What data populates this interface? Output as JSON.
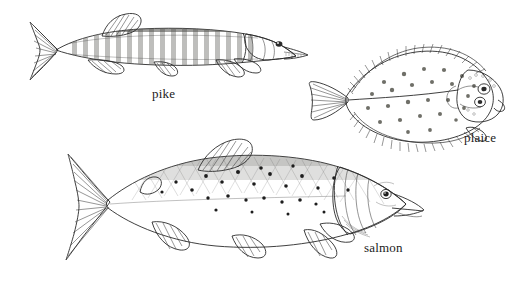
{
  "plate": {
    "title": "Fish species illustration plate",
    "background_color": "#ffffff",
    "ink_color": "#2a2a2a",
    "width": 532,
    "height": 282,
    "style": "grayscale pen-and-ink scientific illustration"
  },
  "figures": [
    {
      "id": "pike",
      "label": "pike",
      "orientation": "facing right",
      "body_fill": "#9b9b97",
      "belly_fill": "#dededa",
      "markings": "vertical pale bars along flank",
      "bbox": {
        "x": 30,
        "y": 14,
        "width": 275,
        "height": 73
      }
    },
    {
      "id": "plaice",
      "label": "plaice",
      "orientation": "facing right",
      "body_fill": "#b0b0ab",
      "belly_fill": "#c6c6c1",
      "markings": "scattered round spots on flatfish disc",
      "bbox": {
        "x": 310,
        "y": 44,
        "width": 190,
        "height": 102
      }
    },
    {
      "id": "salmon",
      "label": "salmon",
      "orientation": "facing right",
      "body_fill": "#a8a8a3",
      "belly_fill": "#f2f2ee",
      "markings": "dark x-shaped spots over stippled flank",
      "bbox": {
        "x": 58,
        "y": 140,
        "width": 370,
        "height": 120
      }
    }
  ],
  "captions": {
    "pike": "pike",
    "plaice": "plaice",
    "salmon": "salmon"
  }
}
